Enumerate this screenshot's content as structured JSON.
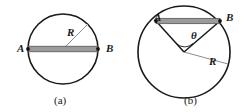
{
  "figure": {
    "width": 244,
    "height": 112,
    "background_color": "#ffffff",
    "stroke_color": "#1a1a1a",
    "chord_fill_color": "#9a9a9a",
    "radius_line_color": "#8c8c8c"
  },
  "panels": [
    {
      "id": "a",
      "caption": "(a)",
      "circle": {
        "cx": 63,
        "cy": 49,
        "r": 35
      },
      "labels": {
        "point_a": "A",
        "point_b": "B",
        "radius": "R"
      },
      "points": {
        "A": {
          "x": 28,
          "y": 49
        },
        "B": {
          "x": 98,
          "y": 49
        }
      },
      "chord": {
        "kind": "diameter",
        "from": "A",
        "to": "B",
        "length_in_radii": 2
      },
      "radius_line": {
        "from": {
          "x": 63,
          "y": 49
        },
        "to": {
          "x": 88,
          "y": 24
        }
      }
    },
    {
      "id": "b",
      "caption": "(b)",
      "circle": {
        "cx": 62,
        "cy": 52,
        "r": 46
      },
      "labels": {
        "point_a": "A",
        "point_b": "B",
        "angle": "θ",
        "radius": "R"
      },
      "points": {
        "A": {
          "x": 34,
          "y": 21
        },
        "B": {
          "x": 98,
          "y": 21
        }
      },
      "chord": {
        "kind": "chord",
        "from": "A",
        "to": "B"
      },
      "radius_line": {
        "from": {
          "x": 62,
          "y": 52
        },
        "to": {
          "x": 106,
          "y": 64
        }
      },
      "angle_marker": {
        "label": "θ",
        "vertex": {
          "x": 62,
          "y": 52
        },
        "arms": [
          "A",
          "B"
        ]
      }
    }
  ]
}
